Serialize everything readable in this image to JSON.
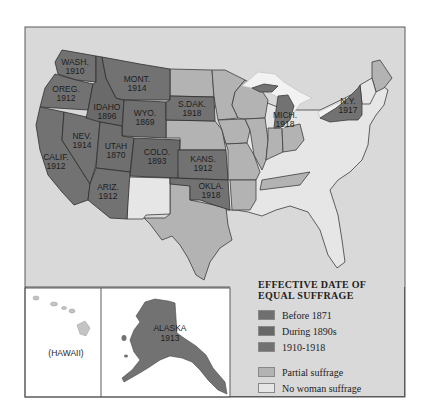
{
  "map": {
    "type": "choropleth",
    "subject": "Woman suffrage in the United States",
    "colors": {
      "before_1871": "#6f6f6f",
      "during_1890s": "#6a6a6a",
      "1910_1918": "#727272",
      "partial": "#b3b3b3",
      "none": "#e6e6e6",
      "background": "#d9d9d9",
      "lakes": "#f2f2f2"
    },
    "states": [
      {
        "name": "WASH.",
        "year": "1910",
        "category": "1910-1918"
      },
      {
        "name": "OREG.",
        "year": "1912",
        "category": "1910-1918"
      },
      {
        "name": "CALIF.",
        "year": "1912",
        "category": "1910-1918"
      },
      {
        "name": "IDAHO",
        "year": "1896",
        "category": "During 1890s"
      },
      {
        "name": "NEV.",
        "year": "1914",
        "category": "1910-1918"
      },
      {
        "name": "UTAH",
        "year": "1870",
        "category": "Before 1871"
      },
      {
        "name": "ARIZ.",
        "year": "1912",
        "category": "1910-1918"
      },
      {
        "name": "MONT.",
        "year": "1914",
        "category": "1910-1918"
      },
      {
        "name": "WYO.",
        "year": "1869",
        "category": "Before 1871"
      },
      {
        "name": "COLO.",
        "year": "1893",
        "category": "During 1890s"
      },
      {
        "name": "S.DAK.",
        "year": "1918",
        "category": "1910-1918"
      },
      {
        "name": "KANS.",
        "year": "1912",
        "category": "1910-1918"
      },
      {
        "name": "OKLA.",
        "year": "1918",
        "category": "1910-1918"
      },
      {
        "name": "MICH.",
        "year": "1918",
        "category": "1910-1918"
      },
      {
        "name": "N.Y.",
        "year": "1917",
        "category": "1910-1918"
      },
      {
        "name": "ALASKA",
        "year": "1913",
        "category": "1910-1918"
      }
    ],
    "insets": {
      "hawaii_label": "(HAWAII)",
      "alaska_label": "ALASKA",
      "alaska_year": "1913"
    }
  },
  "legend": {
    "title_line1": "EFFECTIVE DATE OF",
    "title_line2": "EQUAL SUFFRAGE",
    "items": [
      {
        "label": "Before 1871",
        "color": "#6f6f6f"
      },
      {
        "label": "During 1890s",
        "color": "#686868"
      },
      {
        "label": "1910-1918",
        "color": "#727272"
      },
      {
        "label": "Partial suffrage",
        "color": "#b3b3b3"
      },
      {
        "label": "No woman suffrage",
        "color": "#e6e6e6"
      }
    ]
  }
}
